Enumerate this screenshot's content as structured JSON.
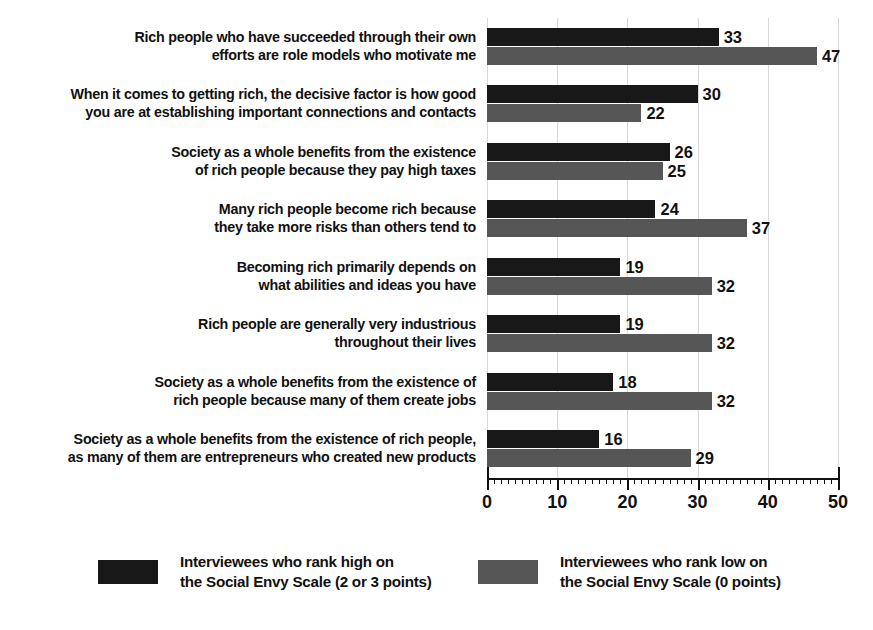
{
  "chart_data": {
    "type": "bar",
    "orientation": "horizontal",
    "grouped": true,
    "title": "",
    "subtitle": "",
    "xlabel": "",
    "ylabel": "",
    "xlim": [
      0,
      50
    ],
    "xticks": [
      0,
      10,
      20,
      30,
      40,
      50
    ],
    "xtick_labels": [
      "0",
      "10",
      "20",
      "30",
      "40",
      "50"
    ],
    "minor_tick_step": 1,
    "grid": true,
    "grid_axis": "x",
    "legend_position": "bottom",
    "categories": [
      "Rich people who have succeeded through their own\nefforts are role models who motivate me",
      "When it comes to getting rich, the decisive factor is how good\nyou are at establishing important connections and contacts",
      "Society as a whole benefits from the existence\nof rich people because they pay high taxes",
      "Many rich people become rich because\nthey take more risks than others tend to",
      "Becoming rich primarily depends on\nwhat abilities and ideas you have",
      "Rich people are generally very industrious\nthroughout their lives",
      "Society as a whole benefits from the existence of\nrich people because many of them create jobs",
      "Society as a whole benefits from the existence of rich people,\nas many of them are entrepreneurs who created new products"
    ],
    "series": [
      {
        "name": "Interviewees who rank high on\nthe Social Envy Scale (2 or 3 points)",
        "color": "#181818",
        "values": [
          33,
          30,
          26,
          24,
          19,
          19,
          18,
          16
        ]
      },
      {
        "name": "Interviewees who rank low on\nthe Social Envy Scale (0 points)",
        "color": "#565656",
        "values": [
          47,
          22,
          25,
          37,
          32,
          32,
          32,
          29
        ]
      }
    ]
  },
  "legend": {
    "entries": [
      {
        "label": "Interviewees who rank high on\nthe Social Envy Scale (2 or 3 points)",
        "color": "#181818"
      },
      {
        "label": "Interviewees who rank low on\nthe Social Envy Scale (0 points)",
        "color": "#565656"
      }
    ]
  },
  "colors": {
    "high_envy": "#181818",
    "low_envy": "#565656",
    "background": "#ffffff",
    "text": "#111111",
    "gridline": "#d8d8d8"
  }
}
